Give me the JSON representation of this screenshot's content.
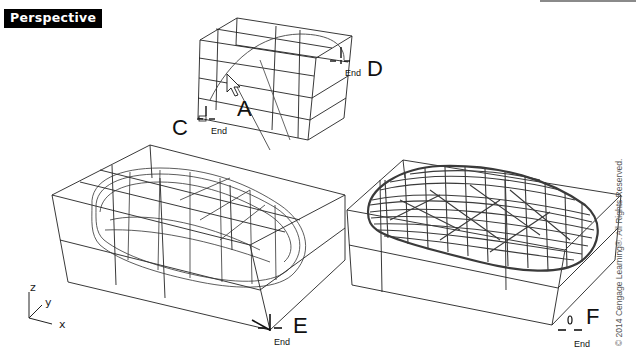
{
  "viewport": {
    "title": "Perspective"
  },
  "callouts": {
    "A": "A",
    "C": "C",
    "D": "D",
    "E": "E",
    "F": "F"
  },
  "snaps": {
    "C": "End",
    "D": "End",
    "E": "End",
    "F": "End"
  },
  "axes": {
    "z": "z",
    "y": "y",
    "x": "x"
  },
  "copyright": "© 2014 Cengage Learning®. All Rights Reserved.",
  "colors": {
    "background": "#ffffff",
    "title_bg": "#000000",
    "title_fg": "#ffffff",
    "wire": "#222222",
    "dense_wire": "#3a3a3a"
  }
}
